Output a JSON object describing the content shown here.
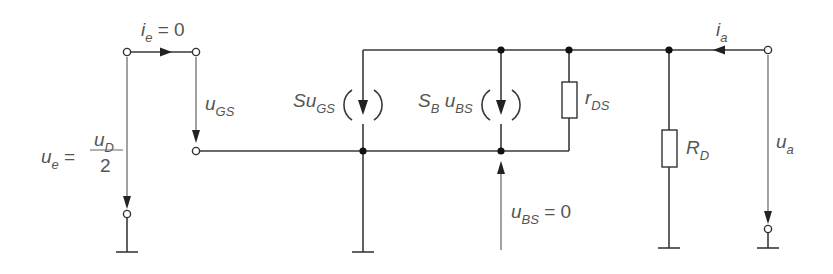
{
  "diagram": {
    "labels": {
      "input_current": {
        "var": "i",
        "sub": "e",
        "rest": " = 0"
      },
      "input_voltage": {
        "var": "u",
        "sub": "e",
        "eq": " = ",
        "frac_num_var": "u",
        "frac_num_sub": "D",
        "frac_den": "2"
      },
      "gate_source_voltage": {
        "var": "u",
        "sub": "GS"
      },
      "source1": {
        "prefix": "Su",
        "sub": "GS"
      },
      "source2": {
        "s": "S",
        "s_sub": "B",
        "u": " u",
        "u_sub": "BS"
      },
      "drain_source_resistance": {
        "var": "r",
        "sub": "DS"
      },
      "drain_resistance": {
        "var": "R",
        "sub": "D"
      },
      "bulk_source_voltage": {
        "var": "u",
        "sub": "BS",
        "rest": " = 0"
      },
      "output_current": {
        "var": "i",
        "sub": "a"
      },
      "output_voltage": {
        "var": "u",
        "sub": "a"
      }
    },
    "components": [
      {
        "type": "terminal",
        "name": "input-terminal-top-left"
      },
      {
        "type": "terminal",
        "name": "input-terminal-top-right"
      },
      {
        "type": "terminal",
        "name": "gate-terminal"
      },
      {
        "type": "terminal",
        "name": "input-terminal-bottom"
      },
      {
        "type": "current-source",
        "name": "transconductance-source",
        "label": "Su_GS"
      },
      {
        "type": "current-source",
        "name": "bulk-transconductance-source",
        "label": "S_B u_BS"
      },
      {
        "type": "resistor",
        "name": "rds-resistor",
        "label": "r_DS"
      },
      {
        "type": "resistor",
        "name": "rd-resistor",
        "label": "R_D"
      },
      {
        "type": "terminal",
        "name": "output-terminal-top"
      },
      {
        "type": "terminal",
        "name": "output-terminal-bottom"
      },
      {
        "type": "ground",
        "count": 4
      }
    ],
    "colors": {
      "wire": "#3a3a3a",
      "text": "#555555",
      "node": "#111111",
      "background": "#ffffff"
    }
  }
}
